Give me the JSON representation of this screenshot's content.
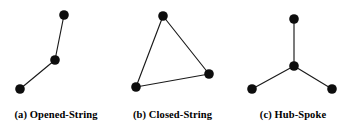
{
  "figure": {
    "background_color": "#ffffff",
    "node_color": "#0d0d0d",
    "edge_color": "#1a1a1a",
    "node_radius": 4.8,
    "edge_width": 1.15
  },
  "panels": [
    {
      "id": "opened-string",
      "caption": "(a) Opened-String",
      "graph_type": "path",
      "nodes": [
        {
          "name": "node-top",
          "x": 64,
          "y": 15
        },
        {
          "name": "node-middle",
          "x": 55,
          "y": 60
        },
        {
          "name": "node-bottom-left",
          "x": 20,
          "y": 89
        }
      ],
      "edges": [
        {
          "from": 0,
          "to": 1
        },
        {
          "from": 1,
          "to": 2
        }
      ]
    },
    {
      "id": "closed-string",
      "caption": "(b) Closed-String",
      "graph_type": "cycle",
      "nodes": [
        {
          "name": "node-top",
          "x": 48,
          "y": 16
        },
        {
          "name": "node-right",
          "x": 94,
          "y": 74
        },
        {
          "name": "node-bottom-left",
          "x": 21,
          "y": 87
        }
      ],
      "edges": [
        {
          "from": 0,
          "to": 1
        },
        {
          "from": 1,
          "to": 2
        },
        {
          "from": 2,
          "to": 0
        }
      ]
    },
    {
      "id": "hub-spoke",
      "caption": "(c) Hub-Spoke",
      "graph_type": "star",
      "nodes": [
        {
          "name": "node-top",
          "x": 64,
          "y": 19
        },
        {
          "name": "node-hub",
          "x": 64,
          "y": 66
        },
        {
          "name": "node-bottom-left",
          "x": 22,
          "y": 89
        },
        {
          "name": "node-bottom-right",
          "x": 102,
          "y": 89
        }
      ],
      "edges": [
        {
          "from": 1,
          "to": 0
        },
        {
          "from": 1,
          "to": 2
        },
        {
          "from": 1,
          "to": 3
        }
      ]
    }
  ]
}
